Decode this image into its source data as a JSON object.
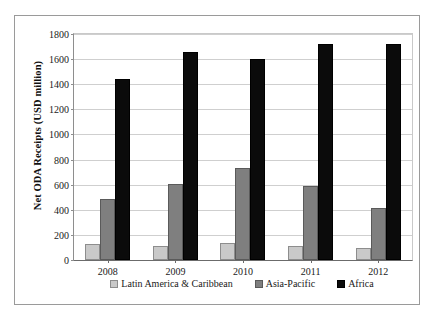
{
  "chart_data": {
    "type": "bar",
    "title": "",
    "xlabel": "",
    "ylabel": "Net ODA Receipts (USD million)",
    "categories": [
      "2008",
      "2009",
      "2010",
      "2011",
      "2012"
    ],
    "series": [
      {
        "name": "Latin America & Caribbean",
        "color": "#c9c9c9",
        "values": [
          125,
          112,
          132,
          115,
          92
        ]
      },
      {
        "name": "Asia-Pacific",
        "color": "#7f7f7f",
        "values": [
          485,
          605,
          730,
          590,
          415
        ]
      },
      {
        "name": "Africa",
        "color": "#0b0b0b",
        "values": [
          1445,
          1660,
          1600,
          1720,
          1720
        ]
      }
    ],
    "ylim": [
      0,
      1800
    ],
    "yticks": [
      0,
      200,
      400,
      600,
      800,
      1000,
      1200,
      1400,
      1600,
      1800
    ],
    "ytick_labels": [
      "0",
      "200",
      "400",
      "600",
      "800",
      "1000",
      "1200",
      "1400",
      "1600",
      "1800"
    ],
    "grid": true,
    "grid_axis": "y",
    "legend_position": "bottom",
    "bar_orientation": "vertical",
    "background_color": "#ffffff",
    "border_color": "#9a9a9a"
  }
}
